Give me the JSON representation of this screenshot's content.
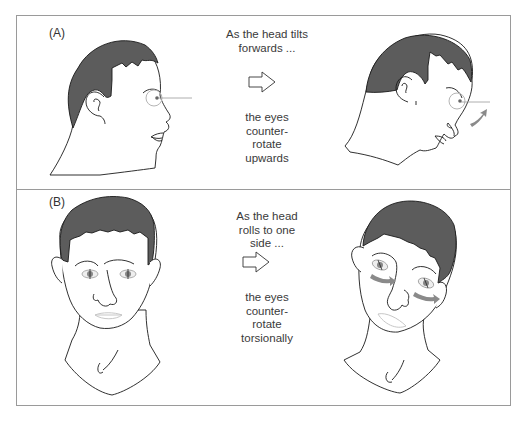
{
  "figure": {
    "colors": {
      "hair": "#5c5c5c",
      "outline": "#1a1a1a",
      "frame": "#9a9a9a",
      "arrow_gray": "#8a8a8a",
      "eye_circle": "#b5b5b5"
    },
    "panels": [
      {
        "label": "(A)",
        "caption_top": [
          "As the head tilts",
          "forwards ..."
        ],
        "arrow_icon": "hollow-right-arrow",
        "caption_bottom": [
          "the eyes",
          "counter-",
          "rotate",
          "upwards"
        ],
        "left_image": "head-profile-upright",
        "right_image": "head-profile-tilted-forward"
      },
      {
        "label": "(B)",
        "caption_top": [
          "As the head",
          "rolls to one",
          "side ..."
        ],
        "arrow_icon": "hollow-right-arrow",
        "caption_bottom": [
          "the eyes",
          "counter-",
          "rotate",
          "torsionally"
        ],
        "left_image": "head-frontal-upright",
        "right_image": "head-frontal-rolled"
      }
    ]
  }
}
